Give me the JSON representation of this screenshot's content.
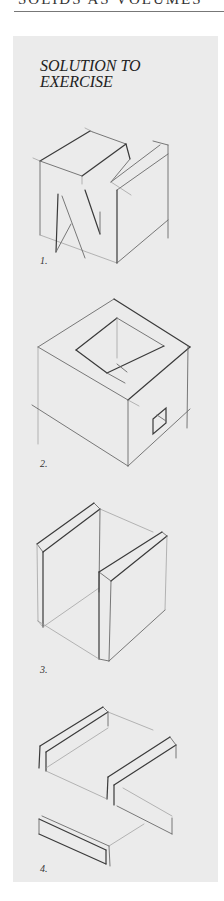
{
  "running_head": {
    "text": "Solids as Volumes"
  },
  "panel": {
    "title_line1": "SOLUTION TO",
    "title_line2": "EXERCISE",
    "background": "#ebebeb"
  },
  "figures": [
    {
      "label": "1.",
      "icon": "notched-cube-sketch-icon"
    },
    {
      "label": "2.",
      "icon": "hollow-cube-sketch-icon"
    },
    {
      "label": "3.",
      "icon": "two-slabs-sketch-icon"
    },
    {
      "label": "4.",
      "icon": "three-beams-sketch-icon"
    }
  ]
}
